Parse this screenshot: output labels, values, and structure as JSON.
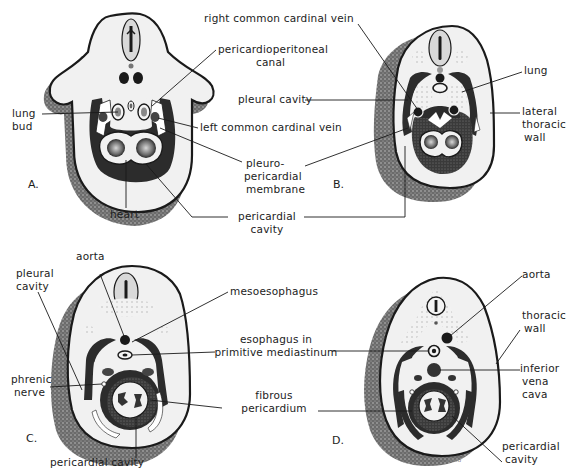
{
  "figure": {
    "panels": [
      {
        "id": "A",
        "label": "A.",
        "annotations": [
          "lung bud",
          "pericardioperitoneal canal",
          "left common cardinal vein",
          "pleuro-pericardial membrane",
          "heart",
          "pericardial cavity"
        ]
      },
      {
        "id": "B",
        "label": "B.",
        "annotations": [
          "right common cardinal vein",
          "pleural cavity",
          "lung",
          "lateral thoracic wall",
          "pleuro-pericardial membrane",
          "pericardial cavity"
        ]
      },
      {
        "id": "C",
        "label": "C.",
        "annotations": [
          "aorta",
          "pleural cavity",
          "mesoesophagus",
          "esophagus in primitive mediastinum",
          "phrenic nerve",
          "fibrous pericardium",
          "pericardial cavity"
        ]
      },
      {
        "id": "D",
        "label": "D.",
        "annotations": [
          "aorta",
          "thoracic wall",
          "inferior vena cava",
          "esophagus in primitive mediastinum",
          "fibrous pericardium",
          "pericardial cavity"
        ]
      }
    ],
    "labels": {
      "right_common_cardinal_vein": "right common cardinal vein",
      "pericardioperitoneal_1": "pericardioperitoneal",
      "pericardioperitoneal_2": "canal",
      "lung_bud_1": "lung",
      "lung_bud_2": "bud",
      "pleural_cavity_b": "pleural cavity",
      "lung": "lung",
      "left_common_cardinal_vein": "left common cardinal vein",
      "lateral_thoracic_1": "lateral",
      "lateral_thoracic_2": "thoracic",
      "lateral_thoracic_3": "wall",
      "pleuro_1": "pleuro-",
      "pleuro_2": "pericardial",
      "pleuro_3": "membrane",
      "heart": "heart",
      "pericardial_cavity_ab_1": "pericardial",
      "pericardial_cavity_ab_2": "cavity",
      "aorta_c": "aorta",
      "pleural_cavity_c_1": "pleural",
      "pleural_cavity_c_2": "cavity",
      "mesoesophagus": "mesoesophagus",
      "esophagus_1": "esophagus in",
      "esophagus_2": "primitive mediastinum",
      "phrenic_1": "phrenic",
      "phrenic_2": "nerve",
      "fibrous_1": "fibrous",
      "fibrous_2": "pericardium",
      "pericardial_cavity_c": "pericardial cavity",
      "aorta_d": "aorta",
      "thoracic_wall_1": "thoracic",
      "thoracic_wall_2": "wall",
      "ivc_1": "inferior",
      "ivc_2": "vena",
      "ivc_3": "cava",
      "pericardial_cavity_d_1": "pericardial",
      "pericardial_cavity_d_2": "cavity",
      "signature": "Reid"
    },
    "colors": {
      "ink": "#1a1a1a",
      "tissue": "#efefef",
      "stipple": "#555555",
      "dark_fill": "#2e2e2e",
      "background": "#ffffff"
    }
  }
}
